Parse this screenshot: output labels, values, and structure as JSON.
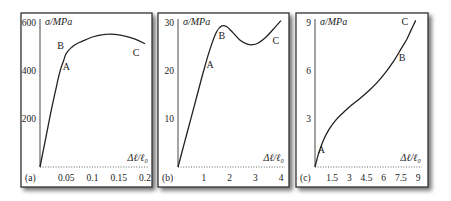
{
  "chart_data": [
    {
      "type": "line",
      "panel_label": "(a)",
      "title": "",
      "ylabel": "σ/MPa",
      "xlabel": "Δℓ/ℓ₀",
      "xlim": [
        0,
        0.2
      ],
      "ylim": [
        0,
        600
      ],
      "xticks": [
        0.05,
        0.1,
        0.15,
        0.2
      ],
      "xtick_labels": [
        "0.05",
        "0.1",
        "0.15",
        "0.2"
      ],
      "yticks": [
        200,
        400,
        600
      ],
      "ytick_labels": [
        "200",
        "400",
        "600"
      ],
      "grid": false,
      "series": [
        {
          "name": "stress-strain",
          "x": [
            0,
            0.01,
            0.02,
            0.03,
            0.035,
            0.04,
            0.045,
            0.05,
            0.06,
            0.07,
            0.08,
            0.1,
            0.12,
            0.13,
            0.14,
            0.16,
            0.18,
            0.2
          ],
          "values": [
            0,
            110,
            220,
            320,
            370,
            410,
            440,
            470,
            495,
            510,
            520,
            538,
            548,
            550,
            549,
            543,
            530,
            510
          ]
        }
      ],
      "annotations": [
        {
          "text": "A",
          "x": 0.05,
          "y": 400
        },
        {
          "text": "B",
          "x": 0.039,
          "y": 490
        },
        {
          "text": "C",
          "x": 0.183,
          "y": 460
        }
      ]
    },
    {
      "type": "line",
      "panel_label": "(b)",
      "title": "",
      "ylabel": "σ/MPa",
      "xlabel": "Δℓ/ℓ₀",
      "xlim": [
        0,
        4
      ],
      "ylim": [
        0,
        30
      ],
      "xticks": [
        1,
        2,
        3,
        4
      ],
      "xtick_labels": [
        "1",
        "2",
        "3",
        "4"
      ],
      "yticks": [
        10,
        20,
        30
      ],
      "ytick_labels": [
        "10",
        "20",
        "30"
      ],
      "grid": false,
      "series": [
        {
          "name": "stress-strain",
          "x": [
            0,
            0.25,
            0.5,
            0.75,
            1.0,
            1.25,
            1.5,
            1.7,
            1.9,
            2.1,
            2.4,
            2.7,
            2.9,
            3.1,
            3.4,
            3.7,
            4.0
          ],
          "values": [
            0,
            5,
            10,
            15,
            20,
            24.5,
            28,
            29.2,
            29.0,
            28,
            26.3,
            25.4,
            25.3,
            25.6,
            26.8,
            28.5,
            30.3
          ]
        }
      ],
      "annotations": [
        {
          "text": "A",
          "x": 1.25,
          "y": 20.5
        },
        {
          "text": "B",
          "x": 1.7,
          "y": 26.5
        },
        {
          "text": "C",
          "x": 3.8,
          "y": 25.5
        }
      ]
    },
    {
      "type": "line",
      "panel_label": "(c)",
      "title": "",
      "ylabel": "σ/MPa",
      "xlabel": "Δℓ/ℓ₀",
      "xlim": [
        0,
        9
      ],
      "ylim": [
        0,
        9
      ],
      "xticks": [
        1.5,
        3,
        4.5,
        6,
        7.5,
        9
      ],
      "xtick_labels": [
        "1.5",
        "3",
        "4.5",
        "6",
        "7.5",
        "9"
      ],
      "yticks": [
        3,
        6,
        9
      ],
      "ytick_labels": [
        "3",
        "6",
        "9"
      ],
      "grid": false,
      "series": [
        {
          "name": "stress-strain",
          "x": [
            0,
            0.3,
            0.7,
            1.2,
            1.8,
            2.5,
            3.2,
            4.0,
            4.8,
            5.5,
            6.2,
            6.9,
            7.5,
            8.0,
            8.4,
            8.8
          ],
          "values": [
            0,
            0.8,
            1.6,
            2.3,
            2.9,
            3.4,
            3.85,
            4.3,
            4.8,
            5.3,
            5.9,
            6.6,
            7.3,
            7.9,
            8.5,
            9.1
          ]
        }
      ],
      "annotations": [
        {
          "text": "A",
          "x": 0.55,
          "y": 0.9
        },
        {
          "text": "B",
          "x": 7.6,
          "y": 6.6
        },
        {
          "text": "C",
          "x": 7.85,
          "y": 8.8
        }
      ]
    }
  ]
}
